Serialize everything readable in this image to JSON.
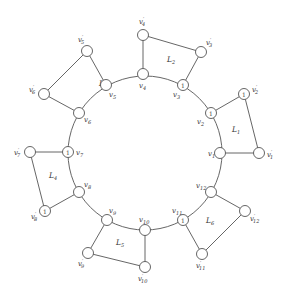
{
  "diagram": {
    "title": "",
    "ring": {
      "cx": 145,
      "cy": 153,
      "r": 77
    },
    "nodes": [
      {
        "id": "v1",
        "label": "v1",
        "x": 220,
        "y": 153,
        "mark": "",
        "lx": 208,
        "ly": 156
      },
      {
        "id": "v2",
        "label": "v2",
        "x": 211,
        "y": 113,
        "mark": "1",
        "lx": 197,
        "ly": 124
      },
      {
        "id": "v3",
        "label": "v3",
        "x": 183,
        "y": 85,
        "mark": "1",
        "lx": 173,
        "ly": 97
      },
      {
        "id": "v4",
        "label": "v4",
        "x": 143,
        "y": 74,
        "mark": "",
        "lx": 139,
        "ly": 88
      },
      {
        "id": "v5",
        "label": "v5",
        "x": 106,
        "y": 85,
        "mark": "",
        "lx": 109,
        "ly": 97
      },
      {
        "id": "v6",
        "label": "v6",
        "x": 79,
        "y": 113,
        "mark": "",
        "lx": 84,
        "ly": 122
      },
      {
        "id": "v7",
        "label": "v7",
        "x": 68,
        "y": 152,
        "mark": "1",
        "lx": 76,
        "ly": 155
      },
      {
        "id": "v8",
        "label": "v8",
        "x": 79,
        "y": 192,
        "mark": "",
        "lx": 84,
        "ly": 187
      },
      {
        "id": "v9",
        "label": "v9",
        "x": 107,
        "y": 220,
        "mark": "",
        "lx": 109,
        "ly": 213
      },
      {
        "id": "v10",
        "label": "v10",
        "x": 145,
        "y": 230,
        "mark": "",
        "lx": 139,
        "ly": 222
      },
      {
        "id": "v11",
        "label": "v11",
        "x": 183,
        "y": 220,
        "mark": "1",
        "lx": 172,
        "ly": 213
      },
      {
        "id": "v12",
        "label": "v12",
        "x": 211,
        "y": 192,
        "mark": "",
        "lx": 196,
        "ly": 188
      },
      {
        "id": "v1p",
        "label": "v'1",
        "x": 259,
        "y": 153,
        "mark": "",
        "lx": 267,
        "ly": 157
      },
      {
        "id": "v2p",
        "label": "v'2",
        "x": 244,
        "y": 94,
        "mark": "1",
        "lx": 252,
        "ly": 92
      },
      {
        "id": "v3p",
        "label": "v'3",
        "x": 201,
        "y": 52,
        "mark": "",
        "lx": 206,
        "ly": 45
      },
      {
        "id": "v4p",
        "label": "v'4",
        "x": 143,
        "y": 35,
        "mark": "",
        "lx": 139,
        "ly": 24
      },
      {
        "id": "v5p",
        "label": "v'5",
        "x": 87,
        "y": 51,
        "mark": "",
        "lx": 78,
        "ly": 42
      },
      {
        "id": "v6p",
        "label": "v'6",
        "x": 44,
        "y": 94,
        "mark": "",
        "lx": 29,
        "ly": 92
      },
      {
        "id": "v7p",
        "label": "v'7",
        "x": 30,
        "y": 152,
        "mark": "",
        "lx": 14,
        "ly": 155
      },
      {
        "id": "v8p",
        "label": "v'8",
        "x": 45,
        "y": 211,
        "mark": "1",
        "lx": 31,
        "ly": 219
      },
      {
        "id": "v9p",
        "label": "v'9",
        "x": 88,
        "y": 253,
        "mark": "",
        "lx": 78,
        "ly": 266
      },
      {
        "id": "v10p",
        "label": "v'10",
        "x": 145,
        "y": 267,
        "mark": "",
        "lx": 138,
        "ly": 281
      },
      {
        "id": "v11p",
        "label": "v'11",
        "x": 202,
        "y": 254,
        "mark": "",
        "lx": 196,
        "ly": 268
      },
      {
        "id": "v12p",
        "label": "v'12",
        "x": 245,
        "y": 211,
        "mark": "",
        "lx": 250,
        "ly": 221
      }
    ],
    "faces": [
      {
        "label": "L1",
        "x": 236,
        "y": 132
      },
      {
        "label": "L2",
        "x": 171,
        "y": 62
      },
      {
        "label": "L3",
        "x": 103,
        "y": 86
      },
      {
        "label": "L4",
        "x": 53,
        "y": 178
      },
      {
        "label": "L5",
        "x": 120,
        "y": 245
      },
      {
        "label": "L6",
        "x": 210,
        "y": 223
      }
    ],
    "quads": [
      [
        "v1",
        "v2",
        "v2p",
        "v1p"
      ],
      [
        "v3",
        "v4",
        "v4p",
        "v3p"
      ],
      [
        "v5",
        "v6",
        "v6p",
        "v5p"
      ],
      [
        "v7",
        "v8",
        "v8p",
        "v7p"
      ],
      [
        "v9",
        "v10",
        "v10p",
        "v9p"
      ],
      [
        "v11",
        "v12",
        "v12p",
        "v11p"
      ]
    ]
  }
}
